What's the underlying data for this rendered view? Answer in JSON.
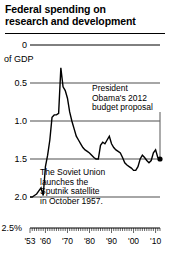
{
  "title": {
    "line1": "Federal spending on",
    "line2": "research and development"
  },
  "annotations": {
    "obama": {
      "line1": "President",
      "line2": "Obama's 2012",
      "line3": "budget proposal"
    },
    "sputnik": {
      "line1": "The Soviet Union",
      "line2": "launches the",
      "line3": "Sputnik satellite",
      "line4": "in October 1957."
    }
  },
  "axis": {
    "y_unit_label": "of GDP",
    "y_ticks": [
      "2.5%",
      "2.0",
      "1.5",
      "1.0",
      "0.5",
      "0"
    ],
    "x_ticks": [
      "'53",
      "'60",
      "'70",
      "'80",
      "'90",
      "'00",
      "'10"
    ]
  },
  "colors": {
    "line": "#000000",
    "grid": "#000000",
    "background": "#ffffff"
  },
  "chart_data": {
    "type": "line",
    "title": "Federal spending on research and development",
    "xlabel": "",
    "ylabel": "of GDP",
    "ylim": [
      0,
      2.5
    ],
    "xlim": [
      1953,
      2012
    ],
    "grid": true,
    "legend": false,
    "y_ticks": [
      0,
      0.5,
      1.0,
      1.5,
      2.0,
      2.5
    ],
    "x_ticks": [
      1953,
      1960,
      1970,
      1980,
      1990,
      2000,
      2010
    ],
    "x_tick_labels": [
      "'53",
      "'60",
      "'70",
      "'80",
      "'90",
      "'00",
      "'10"
    ],
    "units": "percent of GDP",
    "endpoint_marker": {
      "x": 2012,
      "y": 1.0,
      "style": "filled-dot"
    },
    "series": [
      {
        "name": "Federal R&D spending (% of GDP)",
        "x": [
          1953,
          1954,
          1955,
          1956,
          1957,
          1958,
          1959,
          1960,
          1961,
          1962,
          1963,
          1964,
          1965,
          1966,
          1967,
          1968,
          1969,
          1970,
          1971,
          1972,
          1973,
          1974,
          1975,
          1976,
          1977,
          1978,
          1979,
          1980,
          1981,
          1982,
          1983,
          1984,
          1985,
          1986,
          1987,
          1988,
          1989,
          1990,
          1991,
          1992,
          1993,
          1994,
          1995,
          1996,
          1997,
          1998,
          1999,
          2000,
          2001,
          2002,
          2003,
          2004,
          2005,
          2006,
          2007,
          2008,
          2009,
          2010,
          2011,
          2012
        ],
        "values": [
          0.5,
          0.5,
          0.52,
          0.54,
          0.58,
          0.62,
          0.52,
          0.9,
          1.05,
          1.25,
          1.55,
          1.58,
          1.58,
          1.6,
          2.2,
          1.95,
          1.9,
          1.8,
          1.62,
          1.5,
          1.4,
          1.3,
          1.25,
          1.2,
          1.15,
          1.12,
          1.1,
          1.08,
          1.05,
          1.02,
          1.0,
          1.0,
          1.18,
          1.22,
          1.2,
          1.25,
          1.3,
          1.2,
          1.15,
          1.12,
          1.1,
          1.08,
          1.02,
          0.95,
          0.92,
          0.9,
          0.88,
          0.85,
          0.85,
          0.9,
          1.0,
          1.05,
          1.02,
          0.98,
          0.95,
          0.98,
          1.08,
          1.12,
          1.02,
          1.0
        ]
      }
    ]
  }
}
